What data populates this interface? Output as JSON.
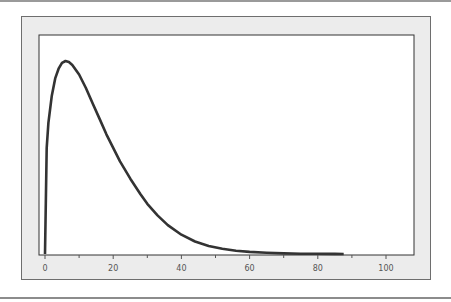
{
  "chart_data": {
    "type": "line",
    "title": "",
    "xlabel": "",
    "ylabel": "",
    "xlim": [
      -2,
      108
    ],
    "xticks": [
      0,
      20,
      40,
      60,
      80,
      100
    ],
    "xtick_labels": [
      "0",
      "20",
      "40",
      "60",
      "80",
      "100"
    ],
    "minor_xticks": [
      10,
      30,
      50,
      70,
      90
    ],
    "grid": false,
    "legend": null,
    "series": [
      {
        "name": "density",
        "color": "#333333",
        "x": [
          0,
          0.5,
          1,
          2,
          3,
          4,
          5,
          6,
          7,
          8,
          10,
          12,
          14,
          16,
          18,
          20,
          22,
          25,
          28,
          30,
          33,
          36,
          40,
          44,
          48,
          52,
          56,
          60,
          65,
          70,
          75,
          80,
          85,
          87.6
        ],
        "y": [
          0,
          0.55,
          0.68,
          0.82,
          0.91,
          0.96,
          0.99,
          1.0,
          0.995,
          0.98,
          0.93,
          0.86,
          0.78,
          0.7,
          0.62,
          0.55,
          0.48,
          0.39,
          0.31,
          0.26,
          0.2,
          0.15,
          0.1,
          0.065,
          0.042,
          0.027,
          0.017,
          0.011,
          0.006,
          0.003,
          0.0015,
          0.0008,
          0.0004,
          0.0002
        ]
      }
    ]
  },
  "axis": {
    "x_tick_labels": [
      "0",
      "20",
      "40",
      "60",
      "80",
      "100"
    ]
  }
}
